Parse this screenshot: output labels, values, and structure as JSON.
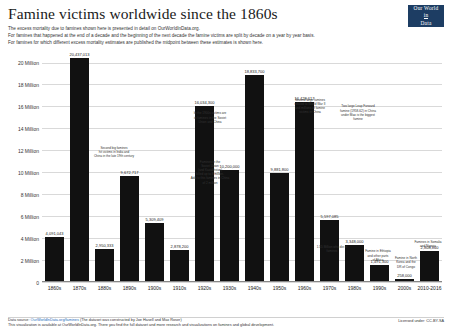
{
  "header": {
    "title": "Famine victims worldwide since the 1860s",
    "subtitle_lines": [
      "The excess mortality due to famines shown here is presented in detail on OurWorldInData.org.",
      "For famines that happened at the end of a decade and the beginning of the next decade the famine victims are split by decade on a year by year basis.",
      "For famines for which different excess mortality estimates are published the midpoint between these estimates is shown here."
    ],
    "logo": {
      "line1": "Our World",
      "line2": "in",
      "line3": "Data"
    }
  },
  "footer": {
    "source_label": "Data source:",
    "source_link1": "OurWorldInData.org/famines",
    "source_mid": "(The dataset was constructed by Joe Hasell and Max Roser)",
    "line2": "This visualization is available at OurWorldInData.org. There you find the full dataset and more research and visualizations on famines and global development.",
    "line2_link": "OurWorldInData.org",
    "license": "Licensed under: CC-BY-SA"
  },
  "chart_data": {
    "type": "bar",
    "title": "Famine victims worldwide since the 1860s",
    "xlabel": "",
    "ylabel": "",
    "ylim": [
      0,
      21000000
    ],
    "grid": true,
    "legend": "none",
    "bar_color": "#111111",
    "ytick_labels": [
      "0",
      "2 Million",
      "4 Million",
      "6 Million",
      "8 Million",
      "10 Million",
      "12 Million",
      "14 Million",
      "16 Million",
      "18 Million",
      "20 Million"
    ],
    "ytick_values": [
      0,
      2000000,
      4000000,
      6000000,
      8000000,
      10000000,
      12000000,
      14000000,
      16000000,
      18000000,
      20000000
    ],
    "categories": [
      "1860s",
      "1870s",
      "1880s",
      "1890s",
      "1900s",
      "1910s",
      "1920s",
      "1930s",
      "1940s",
      "1950s",
      "1960s",
      "1970s",
      "1980s",
      "1990s",
      "2000s",
      "2010-2016"
    ],
    "values": [
      4091043,
      20437013,
      2950333,
      9672717,
      5309409,
      2878200,
      16034300,
      10200000,
      18833700,
      9881800,
      16428617,
      5597085,
      3348000,
      1491300,
      258000,
      2808860
    ],
    "value_labels": [
      "4,091,043",
      "20,437,013",
      "2,950,333",
      "9,672,717",
      "5,309,409",
      "2,878,200",
      "16,034,300",
      "10,200,000",
      "18,833,700",
      "9,881,800",
      "16,428,617",
      "5,597,085",
      "3,348,000",
      "1,491,300",
      "258,000",
      "2,808,860"
    ],
    "annotations": [
      {
        "for": "1870s",
        "text": "Second big famines\nhit victims in India and\nChina in the late 19th century"
      },
      {
        "for": "1900s",
        "text": "In the 1900s victims are\nin famines in the Soviet\nUnion and China"
      },
      {
        "for": "1920s",
        "text": "Famines in the\nSoviet Union\n(and Kazakhstan)\nkilled up to 8 million.\nAdd to this famines in China\nof 2 million"
      },
      {
        "for": "1940s",
        "text": "Second large famines\nrelated to World War II\nand millions of famine\nvictims in China"
      },
      {
        "for": "1960s",
        "text": "Two large Leap Forward\nfamine (1958-62) in China\nunder Mao is the biggest\nfamine"
      },
      {
        "for": "1970s",
        "text": "1.55 Million who die in\nfamines"
      },
      {
        "for": "1980s",
        "text": "Famine in Ethiopia\nand other parts\nof Africa"
      },
      {
        "for": "1990s",
        "text": "Famine in North\nKorea and the\nDR of Congo"
      },
      {
        "for": "2010-2016",
        "text": "Famines in Somalia\nand Nigeria"
      }
    ]
  }
}
